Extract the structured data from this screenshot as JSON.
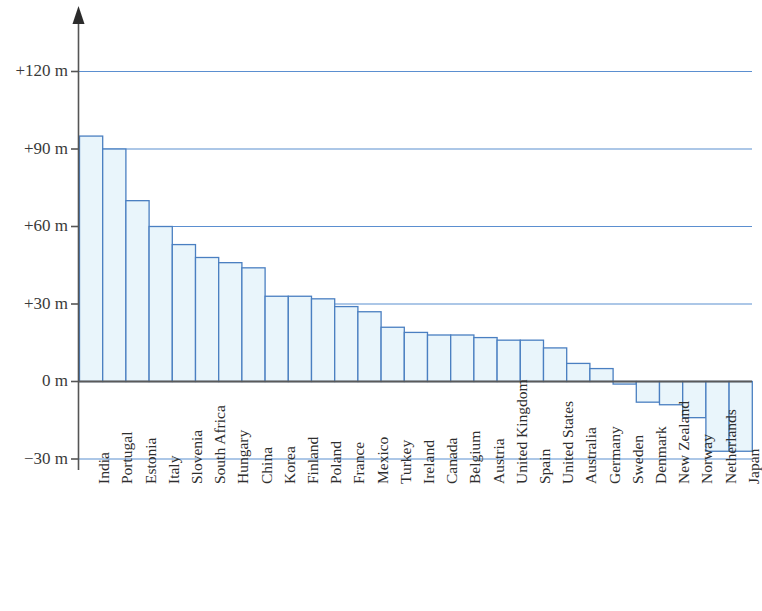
{
  "chart_data": {
    "type": "bar",
    "title": "",
    "subtitle": "",
    "xlabel": "",
    "ylabel": "",
    "unit": "m",
    "ylim": [
      -30,
      132
    ],
    "yticks": [
      -30,
      0,
      30,
      60,
      90,
      120
    ],
    "ytick_labels": [
      "−30 m",
      "0 m",
      "+30 m",
      "+60 m",
      "+90 m",
      "+120 m"
    ],
    "gridlines": [
      -30,
      30,
      60,
      90,
      120
    ],
    "grid": true,
    "legend": "none",
    "bar_fill_color": "#e9f5fb",
    "bar_stroke_color": "#4a7fc1",
    "gridline_color": "#5b8fd0",
    "axis_color": "#555555",
    "categories": [
      "India",
      "Portugal",
      "Estonia",
      "Italy",
      "Slovenia",
      "South Africa",
      "Hungary",
      "China",
      "Korea",
      "Finland",
      "Poland",
      "France",
      "Mexico",
      "Turkey",
      "Ireland",
      "Canada",
      "Belgium",
      "Austria",
      "United Kingdom",
      "Spain",
      "United States",
      "Australia",
      "Germany",
      "Sweden",
      "Denmark",
      "New Zealand",
      "Norway",
      "Netherlands",
      "Japan"
    ],
    "values": [
      95,
      90,
      70,
      60,
      53,
      48,
      46,
      44,
      33,
      33,
      32,
      29,
      27,
      21,
      19,
      18,
      18,
      17,
      16,
      16,
      13,
      7,
      5,
      -1,
      -8,
      -9,
      -14,
      -27,
      -27
    ]
  }
}
